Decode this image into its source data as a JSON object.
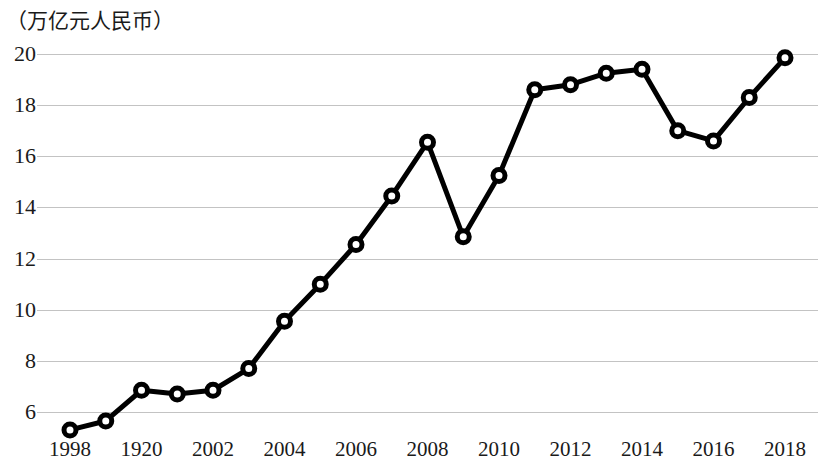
{
  "chart_data": {
    "type": "line",
    "title": "",
    "subtitle": "",
    "unit_label": "（万亿元人民币）",
    "xlabel": "",
    "ylabel": "",
    "grid": true,
    "legend": false,
    "marker": "open-circle",
    "line_color": "#000000",
    "grid_color": "#b9b9b9",
    "xlim": [
      1998,
      2018
    ],
    "ylim": [
      4.8,
      20.4
    ],
    "yticks": [
      6,
      8,
      10,
      12,
      14,
      16,
      18,
      20
    ],
    "ytick_labels": [
      "6",
      "8",
      "10",
      "12",
      "14",
      "16",
      "18",
      "20"
    ],
    "xtick_values": [
      1998,
      2000,
      2002,
      2004,
      2006,
      2008,
      2010,
      2012,
      2014,
      2016,
      2018
    ],
    "xtick_labels": [
      "1998",
      "1920",
      "2002",
      "2004",
      "2006",
      "2008",
      "2010",
      "2012",
      "2014",
      "2016",
      "2018"
    ],
    "x": [
      1998,
      1999,
      2000,
      2001,
      2002,
      2003,
      2004,
      2005,
      2006,
      2007,
      2008,
      2009,
      2010,
      2011,
      2012,
      2013,
      2014,
      2015,
      2016,
      2017,
      2018
    ],
    "values": [
      5.3,
      5.65,
      6.85,
      6.7,
      6.85,
      7.7,
      9.55,
      11.0,
      12.55,
      14.45,
      16.55,
      12.85,
      15.25,
      18.6,
      18.8,
      19.25,
      19.4,
      17.0,
      16.6,
      18.3,
      19.85
    ]
  }
}
